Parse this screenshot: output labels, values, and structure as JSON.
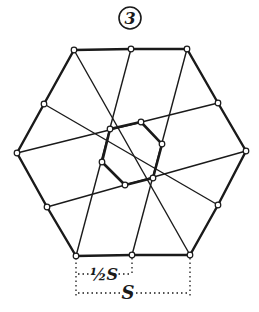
{
  "figure": {
    "number_label": "3",
    "half_side_label": "½S",
    "side_label": "S",
    "stroke_color": "#1a1a1a",
    "background": "#ffffff"
  },
  "outer_hexagon": [
    [
      74,
      50
    ],
    [
      131,
      49
    ],
    [
      187,
      49
    ],
    [
      218,
      103
    ],
    [
      246,
      151
    ],
    [
      218,
      205
    ],
    [
      190,
      255
    ],
    [
      132,
      255
    ],
    [
      76,
      256
    ],
    [
      47,
      207
    ],
    [
      17,
      153
    ],
    [
      44,
      104
    ]
  ],
  "inner_hexagon": [
    [
      110,
      129
    ],
    [
      141,
      122
    ],
    [
      162,
      144
    ],
    [
      153,
      178
    ],
    [
      125,
      185
    ],
    [
      102,
      162
    ]
  ],
  "lines": [
    [
      [
        17,
        153
      ],
      [
        218,
        103
      ]
    ],
    [
      [
        47,
        207
      ],
      [
        246,
        151
      ]
    ],
    [
      [
        44,
        104
      ],
      [
        218,
        205
      ]
    ],
    [
      [
        74,
        50
      ],
      [
        190,
        255
      ]
    ],
    [
      [
        131,
        49
      ],
      [
        76,
        256
      ]
    ],
    [
      [
        187,
        49
      ],
      [
        132,
        255
      ]
    ]
  ]
}
